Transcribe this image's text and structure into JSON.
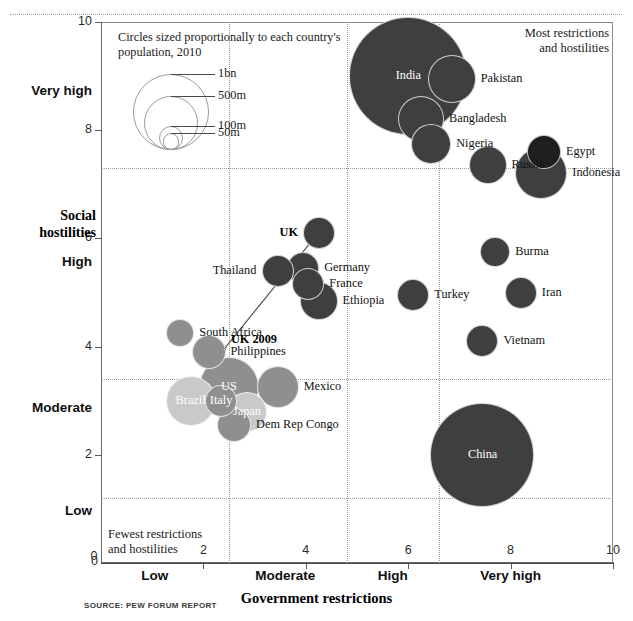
{
  "chart_data": {
    "type": "scatter",
    "title": "",
    "xlabel": "Government restrictions",
    "ylabel": "Social hostilities",
    "xlim": [
      0,
      10
    ],
    "ylim": [
      0,
      10
    ],
    "grid": true,
    "legend_position": "top-left",
    "size_legend": {
      "caption": "Circles sized proportionally to each country's population, 2010",
      "entries": [
        {
          "label": "1bn",
          "value": 1000
        },
        {
          "label": "500m",
          "value": 500
        },
        {
          "label": "100m",
          "value": 100
        },
        {
          "label": "50m",
          "value": 50
        }
      ]
    },
    "annotations": [
      {
        "name": "most-restrictions-note",
        "text": "Most restrictions and hostilities",
        "position": "top-right"
      },
      {
        "name": "fewest-restrictions-note",
        "text": "Fewest restrictions and hostilities",
        "position": "bottom-left"
      },
      {
        "name": "uk-trend-arrow",
        "text": "UK 2009",
        "from": [
          2.4,
          3.95
        ],
        "to": [
          4.2,
          6.05
        ]
      }
    ],
    "xticks": [
      {
        "value": 0,
        "label": "0"
      },
      {
        "value": 2,
        "label": "2"
      },
      {
        "value": 4,
        "label": "4"
      },
      {
        "value": 6,
        "label": "6"
      },
      {
        "value": 8,
        "label": "8"
      },
      {
        "value": 10,
        "label": "10"
      }
    ],
    "yticks": [
      {
        "value": 0,
        "label": "0"
      },
      {
        "value": 2,
        "label": "2"
      },
      {
        "value": 4,
        "label": "4"
      },
      {
        "value": 6,
        "label": "6"
      },
      {
        "value": 8,
        "label": "8"
      },
      {
        "value": 10,
        "label": "10"
      }
    ],
    "x_band_labels": [
      {
        "label": "Low",
        "center": 1.05
      },
      {
        "label": "Moderate",
        "center": 3.6
      },
      {
        "label": "High",
        "center": 5.7
      },
      {
        "label": "Very high",
        "center": 8.0
      }
    ],
    "y_band_labels": [
      {
        "label": "Low",
        "center": 0.95
      },
      {
        "label": "Moderate",
        "center": 2.85
      },
      {
        "label": "High",
        "center": 5.55
      },
      {
        "label": "Very high",
        "center": 8.7
      }
    ],
    "x_gridlines": [
      2.5,
      4.8,
      6.6
    ],
    "y_gridlines": [
      1.2,
      3.4,
      7.3
    ],
    "points": [
      {
        "name": "India",
        "x": 6.0,
        "y": 9.0,
        "r": 59,
        "shade": "dark",
        "label_pos": "inside"
      },
      {
        "name": "Pakistan",
        "x": 6.85,
        "y": 8.95,
        "r": 24,
        "shade": "dark",
        "label_pos": "right"
      },
      {
        "name": "Bangladesh",
        "x": 6.25,
        "y": 8.2,
        "r": 23,
        "shade": "dark",
        "label_pos": "right"
      },
      {
        "name": "Nigeria",
        "x": 6.45,
        "y": 7.75,
        "r": 20,
        "shade": "dark",
        "label_pos": "right"
      },
      {
        "name": "Russia",
        "x": 7.55,
        "y": 7.35,
        "r": 19,
        "shade": "dark",
        "label_pos": "right"
      },
      {
        "name": "Egypt",
        "x": 8.65,
        "y": 7.6,
        "r": 17,
        "shade": "darkest",
        "label_pos": "right"
      },
      {
        "name": "Indonesia",
        "x": 8.6,
        "y": 7.2,
        "r": 26,
        "shade": "dark",
        "label_pos": "right"
      },
      {
        "name": "Burma",
        "x": 7.7,
        "y": 5.75,
        "r": 15,
        "shade": "dark",
        "label_pos": "right"
      },
      {
        "name": "Iran",
        "x": 8.2,
        "y": 5.0,
        "r": 16,
        "shade": "dark",
        "label_pos": "right"
      },
      {
        "name": "Vietnam",
        "x": 7.45,
        "y": 4.1,
        "r": 16,
        "shade": "dark",
        "label_pos": "right"
      },
      {
        "name": "China",
        "x": 7.45,
        "y": 2.0,
        "r": 52,
        "shade": "dark",
        "label_pos": "inside"
      },
      {
        "name": "Turkey",
        "x": 6.1,
        "y": 4.95,
        "r": 16,
        "shade": "dark",
        "label_pos": "right"
      },
      {
        "name": "UK",
        "x": 4.25,
        "y": 6.1,
        "r": 16,
        "shade": "dark",
        "label_pos": "left",
        "bold": true
      },
      {
        "name": "Germany",
        "x": 3.95,
        "y": 5.45,
        "r": 16,
        "shade": "dark",
        "label_pos": "right"
      },
      {
        "name": "France",
        "x": 4.05,
        "y": 5.15,
        "r": 16,
        "shade": "dark",
        "label_pos": "right"
      },
      {
        "name": "Ethiopia",
        "x": 4.25,
        "y": 4.85,
        "r": 19,
        "shade": "dark",
        "label_pos": "right"
      },
      {
        "name": "Thailand",
        "x": 3.45,
        "y": 5.4,
        "r": 16,
        "shade": "dark",
        "label_pos": "left"
      },
      {
        "name": "South Africa",
        "x": 1.55,
        "y": 4.25,
        "r": 14,
        "shade": "medium",
        "label_pos": "right"
      },
      {
        "name": "Philippines",
        "x": 2.1,
        "y": 3.9,
        "r": 17,
        "shade": "medium",
        "label_pos": "right"
      },
      {
        "name": "Brazil",
        "x": 1.75,
        "y": 3.0,
        "r": 25,
        "shade": "light",
        "label_pos": "inside"
      },
      {
        "name": "Japan",
        "x": 2.85,
        "y": 2.8,
        "r": 20,
        "shade": "light",
        "label_pos": "inside"
      },
      {
        "name": "US",
        "x": 2.5,
        "y": 3.25,
        "r": 30,
        "shade": "medium",
        "label_pos": "inside"
      },
      {
        "name": "Italy",
        "x": 2.35,
        "y": 3.0,
        "r": 16,
        "shade": "medium",
        "label_pos": "inside"
      },
      {
        "name": "Dem Rep Congo",
        "x": 2.6,
        "y": 2.55,
        "r": 17,
        "shade": "medium",
        "label_pos": "right"
      },
      {
        "name": "Mexico",
        "x": 3.45,
        "y": 3.25,
        "r": 21,
        "shade": "medium",
        "label_pos": "right"
      }
    ]
  },
  "source": {
    "text": "SOURCE: PEW FORUM REPORT"
  },
  "colors": {
    "dark": "#3f3f3f",
    "darkest": "#1f1f1f",
    "medium": "#8f8f8f",
    "light": "#c9c9c9",
    "grid": "#9a9a9a",
    "axis": "#6a6a6a"
  }
}
